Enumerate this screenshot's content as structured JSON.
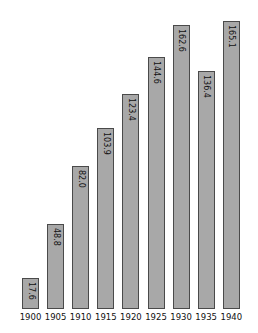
{
  "chart_data": {
    "type": "bar",
    "title": "",
    "title_note": "title cropped at top edge, not legible",
    "xlabel": "",
    "ylabel": "",
    "categories": [
      "1900",
      "1905",
      "1910",
      "1915",
      "1920",
      "1925",
      "1930",
      "1935",
      "1940"
    ],
    "values": [
      17.6,
      48.8,
      82.0,
      103.9,
      123.4,
      144.6,
      162.6,
      136.4,
      165.1
    ],
    "value_labels": [
      "17.6",
      "48.8",
      "82.0",
      "103.9",
      "123.4",
      "144.6",
      "162.6",
      "136.4",
      "165.1"
    ],
    "ylim": [
      0,
      165.1
    ],
    "grid": false,
    "legend": null,
    "colors": {
      "bar_fill": "#a8a8a8",
      "bar_border": "#4a4a4a",
      "text": "#111111"
    }
  }
}
